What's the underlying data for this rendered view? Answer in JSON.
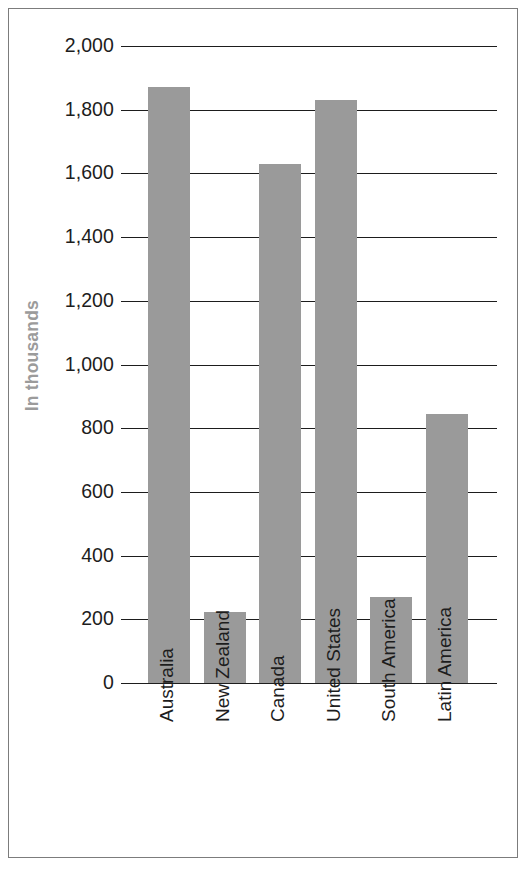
{
  "chart_data": {
    "type": "bar",
    "title": "",
    "subtitle": "",
    "xlabel": "",
    "ylabel": "In thousands",
    "categories": [
      "Australia",
      "New Zealand",
      "Canada",
      "United States",
      "South America",
      "Latin America"
    ],
    "values": [
      1870,
      222,
      1630,
      1830,
      270,
      845
    ],
    "ylim": [
      0,
      2000
    ],
    "ytick_values": [
      0,
      200,
      400,
      600,
      800,
      1000,
      1200,
      1400,
      1600,
      1800,
      2000
    ],
    "ytick_labels": [
      "0",
      "200",
      "400",
      "600",
      "800",
      "1,000",
      "1,200",
      "1,400",
      "1,600",
      "1,800",
      "2,000"
    ],
    "grid": true,
    "grid_axis": "y",
    "legend": false,
    "legend_position": "none",
    "series": [
      {
        "name": "",
        "values": [
          1870,
          222,
          1630,
          1830,
          270,
          845
        ]
      }
    ],
    "annotations": []
  },
  "style": {
    "bar_color": "#9a9a9a",
    "grid_color": "#1d1d1d",
    "axis_color": "#1d1d1d",
    "tick_label_color": "#1d1d1d",
    "ylabel_color": "#9b9b9b",
    "border_color": "#7c7c7c",
    "background": "#ffffff"
  }
}
